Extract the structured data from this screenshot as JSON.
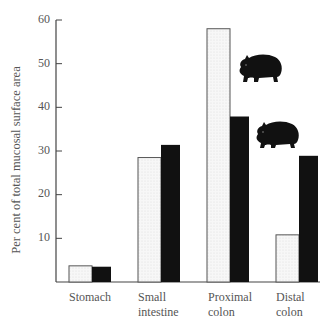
{
  "chart_data": {
    "type": "bar",
    "title": "",
    "xlabel": "",
    "ylabel": "Per cent of total mucosal surface area",
    "ylim": [
      0,
      60
    ],
    "yticks": [
      10,
      20,
      30,
      40,
      50,
      60
    ],
    "grid": false,
    "legend": "none (series indicated by wombat silhouettes)",
    "categories": [
      "Stomach",
      "Small intestine",
      "Proximal colon",
      "Distal colon"
    ],
    "category_labels": [
      [
        "Stomach"
      ],
      [
        "Small",
        "intestine"
      ],
      [
        "Proximal",
        "colon"
      ],
      [
        "Distal",
        "colon"
      ]
    ],
    "series": [
      {
        "name": "Series 1 (light/stippled bars)",
        "color": "#f4f4f4",
        "values": [
          3.7,
          28.5,
          58,
          10.8
        ]
      },
      {
        "name": "Series 2 (black bars, wombat)",
        "color": "#111111",
        "values": [
          3.5,
          31.4,
          37.9,
          28.9
        ]
      }
    ],
    "annotations": [
      "wombat silhouette (upper)",
      "wombat silhouette (lower)"
    ]
  },
  "axis": {
    "ylabel": "Per cent of total mucosal surface area",
    "ticks": [
      "10",
      "20",
      "30",
      "40",
      "50",
      "60"
    ]
  },
  "labels": {
    "cat0_l1": "Stomach",
    "cat1_l1": "Small",
    "cat1_l2": "intestine",
    "cat2_l1": "Proximal",
    "cat2_l2": "colon",
    "cat3_l1": "Distal",
    "cat3_l2": "colon"
  }
}
